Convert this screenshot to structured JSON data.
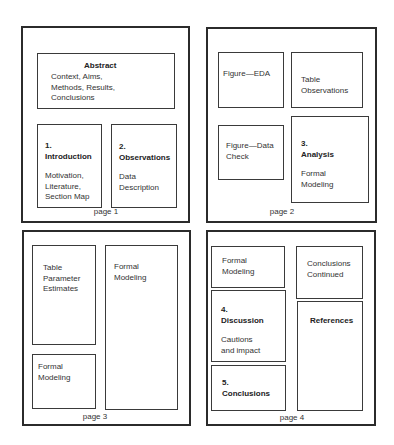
{
  "pages": [
    {
      "label": "page 1",
      "boxes": {
        "abstract": {
          "title": "Abstract",
          "lines": [
            "Context, Aims,",
            "Methods, Results,",
            "Conclusions"
          ]
        },
        "introduction": {
          "number": "1.",
          "title": "Introduction",
          "lines": [
            "Motivation,",
            "Literature,",
            "Section Map"
          ]
        },
        "observations": {
          "number": "2.",
          "title": "Observations",
          "lines": [
            "Data",
            "Description"
          ]
        }
      }
    },
    {
      "label": "page 2",
      "boxes": {
        "figure_eda": {
          "lines": [
            "Figure—EDA"
          ]
        },
        "table_observations": {
          "lines": [
            "Table",
            "Observations"
          ]
        },
        "figure_data_check": {
          "lines": [
            "Figure—Data",
            "Check"
          ]
        },
        "analysis": {
          "number": "3.",
          "title": "Analysis",
          "lines": [
            "Formal",
            "Modeling"
          ]
        }
      }
    },
    {
      "label": "page 3",
      "boxes": {
        "table_parameter_estimates": {
          "lines": [
            "Table",
            "Parameter",
            "Estimates"
          ]
        },
        "formal_modeling_tall": {
          "lines": [
            "Formal",
            "Modeling"
          ]
        },
        "formal_modeling_small": {
          "lines": [
            "Formal",
            "Modeling"
          ]
        }
      }
    },
    {
      "label": "page 4",
      "boxes": {
        "formal_modeling": {
          "lines": [
            "Formal",
            "Modeling"
          ]
        },
        "conclusions_continued": {
          "lines": [
            "Conclusions",
            "Continued"
          ]
        },
        "discussion": {
          "number": "4.",
          "title": "Discussion",
          "lines": [
            "Cautions",
            "and impact"
          ]
        },
        "references": {
          "title": "References"
        },
        "conclusions": {
          "number": "5.",
          "title": "Conclusions"
        }
      }
    }
  ]
}
